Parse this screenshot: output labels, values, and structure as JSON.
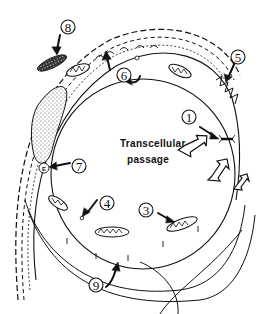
{
  "diagram": {
    "title_label": {
      "line1": "Transcellular",
      "line2": "passage"
    },
    "numbered_labels": [
      {
        "id": "1",
        "text": "1"
      },
      {
        "id": "2",
        "text": ""
      },
      {
        "id": "3",
        "text": "3"
      },
      {
        "id": "4",
        "text": "4"
      },
      {
        "id": "5",
        "text": "5"
      },
      {
        "id": "6",
        "text": "6"
      },
      {
        "id": "7",
        "text": "7"
      },
      {
        "id": "8",
        "text": "8"
      },
      {
        "id": "9",
        "text": "9"
      }
    ],
    "small_marker": "E",
    "colors": {
      "ink": "#111111",
      "background": "#ffffff",
      "stipple": "#555555"
    }
  }
}
